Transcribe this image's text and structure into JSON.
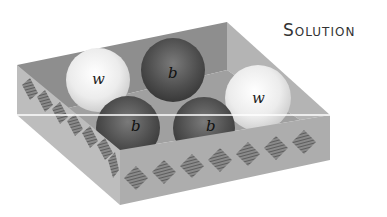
{
  "title": "Solution",
  "colors": {
    "box_inner_back": "#8e8e8e",
    "box_inner_right": "#b4b4b4",
    "box_face_left": "#bdbdbd",
    "box_face_front": "#a9a9a9",
    "diamond": "#6a6a6a",
    "white_ball": "#f2f2f2",
    "black_ball": "#4d4d4d",
    "highlight_line": "#ffffff"
  },
  "balls": [
    {
      "label": "w",
      "color": "white"
    },
    {
      "label": "b",
      "color": "black"
    },
    {
      "label": "w",
      "color": "white"
    },
    {
      "label": "b",
      "color": "black"
    },
    {
      "label": "b",
      "color": "black"
    }
  ]
}
